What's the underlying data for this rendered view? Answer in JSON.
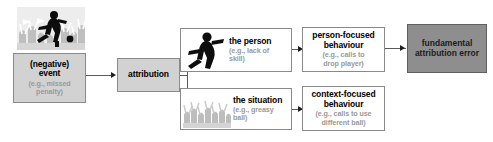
{
  "diagram": {
    "colors": {
      "box_fill_gray": "#d2d2d2",
      "box_fill_white": "#ffffff",
      "box_fill_dark": "#8e8e8e",
      "border": "#8a8a8a",
      "title_text": "#000000",
      "sub_text": "#9a9a9a",
      "connector": "#5a5a5a"
    },
    "photo": {
      "alt": "soccer player kicking ball in front of crowd",
      "icon": "soccer-player-photo"
    },
    "nodes": {
      "event": {
        "title_line1": "(negative)",
        "title_line2": "event",
        "sub_line1": "(e.g., missed",
        "sub_line2": "penalty)"
      },
      "attribution": {
        "title": "attribution"
      },
      "person": {
        "icon": "person-silhouette-icon",
        "title": "the person",
        "sub_line1": "(e.g., lack of",
        "sub_line2": "skill)"
      },
      "situation": {
        "icon": "crowd-silhouette-icon",
        "title": "the situation",
        "sub_line1": "(e.g., greasy",
        "sub_line2": "ball)"
      },
      "person_focused": {
        "title_line1": "person-focused",
        "title_line2": "behaviour",
        "sub_line1": "(e.g., calls to",
        "sub_line2": "drop player)"
      },
      "context_focused": {
        "title_line1": "context-focused",
        "title_line2": "behaviour",
        "sub_line1": "(e.g., calls to use",
        "sub_line2": "different ball)"
      },
      "fae": {
        "title_line1": "fundamental",
        "title_line2": "attribution error"
      }
    }
  }
}
